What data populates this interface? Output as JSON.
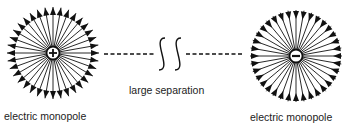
{
  "diagram": {
    "left_charge": {
      "label": "electric monopole",
      "sign": "+",
      "field_direction": "outward",
      "center": [
        53,
        53
      ],
      "radius": 46,
      "num_field_lines": 36
    },
    "right_charge": {
      "label": "electric monopole",
      "sign": "−",
      "field_direction": "inward",
      "center": [
        296,
        56
      ],
      "radius": 46,
      "num_field_lines": 36
    },
    "separation": {
      "label": "large separation",
      "break_symbol": "double-squiggle"
    },
    "colors": {
      "stroke": "#111111",
      "background": "#ffffff",
      "text": "#222222"
    }
  }
}
